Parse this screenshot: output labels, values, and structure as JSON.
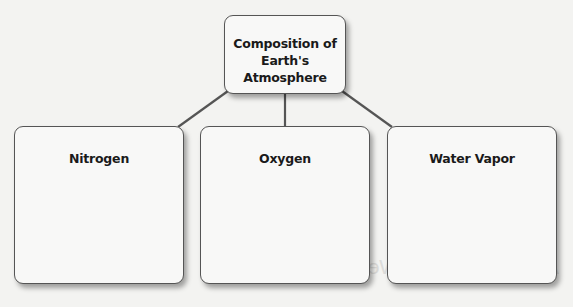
{
  "diagram": {
    "type": "concept-map",
    "root": {
      "label_line1": "Composition of",
      "label_line2": "Earth's Atmosphere"
    },
    "children": [
      {
        "label": "Nitrogen",
        "content": ""
      },
      {
        "label": "Oxygen",
        "content": ""
      },
      {
        "label": "Water Vapor",
        "content": ""
      }
    ],
    "edges": [
      {
        "from": "root",
        "to": "Nitrogen"
      },
      {
        "from": "root",
        "to": "Oxygen"
      },
      {
        "from": "root",
        "to": "Water Vapor"
      }
    ]
  },
  "background": {
    "bleed_text": "Atmosphere and Weather"
  },
  "colors": {
    "line": "#555555",
    "box_fill": "#f8f8f7",
    "page": "#f3f3f1",
    "text": "#1a1a1a"
  }
}
